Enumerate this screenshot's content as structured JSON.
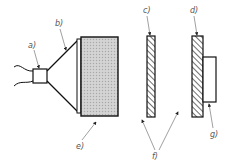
{
  "diagram": {
    "type": "schematic",
    "colors": {
      "line": "#111111",
      "leader": "#777777",
      "fill_dotted": "#c9c9c9",
      "label": "#555555"
    },
    "labels": {
      "a": "a)",
      "b": "b)",
      "c": "c)",
      "d": "d)",
      "e": "e)",
      "f": "f)",
      "g": "g)"
    },
    "components": [
      {
        "id": "a",
        "name": "source-box"
      },
      {
        "id": "b",
        "name": "cone-horn"
      },
      {
        "id": "c",
        "name": "hatched-plate-1"
      },
      {
        "id": "d",
        "name": "hatched-plate-2"
      },
      {
        "id": "e",
        "name": "dotted-block"
      },
      {
        "id": "f",
        "name": "gaps"
      },
      {
        "id": "g",
        "name": "attached-box"
      }
    ]
  }
}
